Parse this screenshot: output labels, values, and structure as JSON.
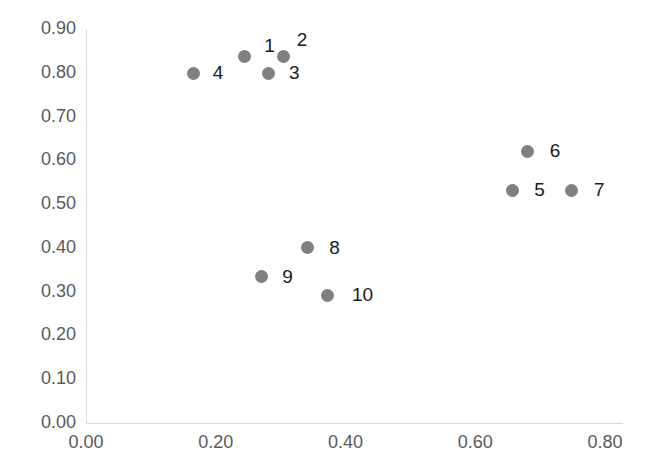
{
  "chart_data": {
    "type": "scatter",
    "title": "",
    "subtitle": "",
    "xlabel": "",
    "ylabel": "",
    "xlim": [
      0.0,
      0.8
    ],
    "ylim": [
      0.0,
      0.9
    ],
    "grid": false,
    "legend": null,
    "marker_color": "#808080",
    "axis_color": "#d9d9d9",
    "tick_label_color": "#595959",
    "point_label_color": "#1a1a1a",
    "x_ticks": [
      {
        "value": 0.0,
        "label": "0.00"
      },
      {
        "value": 0.2,
        "label": "0.20"
      },
      {
        "value": 0.4,
        "label": "0.40"
      },
      {
        "value": 0.6,
        "label": "0.60"
      },
      {
        "value": 0.8,
        "label": "0.80"
      }
    ],
    "y_ticks": [
      {
        "value": 0.0,
        "label": "0.00"
      },
      {
        "value": 0.1,
        "label": "0.10"
      },
      {
        "value": 0.2,
        "label": "0.20"
      },
      {
        "value": 0.3,
        "label": "0.30"
      },
      {
        "value": 0.4,
        "label": "0.40"
      },
      {
        "value": 0.5,
        "label": "0.50"
      },
      {
        "value": 0.6,
        "label": "0.60"
      },
      {
        "value": 0.7,
        "label": "0.70"
      },
      {
        "value": 0.8,
        "label": "0.80"
      },
      {
        "value": 0.9,
        "label": "0.90"
      }
    ],
    "points": [
      {
        "label": "1",
        "x": 0.244,
        "y": 0.836,
        "label_dx": 20,
        "label_dy": -11
      },
      {
        "label": "2",
        "x": 0.305,
        "y": 0.836,
        "label_dx": 13,
        "label_dy": -17
      },
      {
        "label": "3",
        "x": 0.282,
        "y": 0.799,
        "label_dx": 20,
        "label_dy": 0
      },
      {
        "label": "4",
        "x": 0.166,
        "y": 0.799,
        "label_dx": 19,
        "label_dy": 0
      },
      {
        "label": "5",
        "x": 0.657,
        "y": 0.532,
        "label_dx": 22,
        "label_dy": 0
      },
      {
        "label": "6",
        "x": 0.681,
        "y": 0.621,
        "label_dx": 22,
        "label_dy": 0
      },
      {
        "label": "7",
        "x": 0.749,
        "y": 0.532,
        "label_dx": 22,
        "label_dy": 0
      },
      {
        "label": "8",
        "x": 0.341,
        "y": 0.4,
        "label_dx": 22,
        "label_dy": 0
      },
      {
        "label": "9",
        "x": 0.27,
        "y": 0.334,
        "label_dx": 21,
        "label_dy": 0
      },
      {
        "label": "10",
        "x": 0.373,
        "y": 0.292,
        "label_dx": 24,
        "label_dy": 0
      }
    ]
  }
}
